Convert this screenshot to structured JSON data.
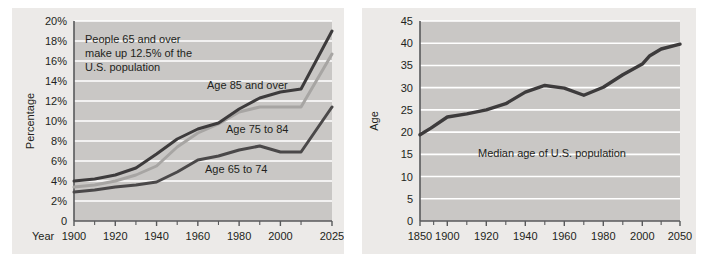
{
  "figure": {
    "background": "#ffffff",
    "panel_background": "#eceae8",
    "plot_background": "#c9c7c5",
    "gridline_color": "#ffffff",
    "axis_color": "#58595b",
    "text_color": "#231f20"
  },
  "chart_data": [
    {
      "id": "left",
      "type": "line",
      "title": "",
      "xlabel": "Year",
      "ylabel": "Percentage",
      "xlim": [
        1900,
        2025
      ],
      "ylim": [
        0,
        20
      ],
      "grid": true,
      "legend": "inline-labels",
      "x_tick_labels": [
        "1900",
        "1920",
        "1940",
        "1960",
        "1980",
        "2000",
        "2025"
      ],
      "x_tick_values": [
        1900,
        1920,
        1940,
        1960,
        1980,
        2000,
        2025
      ],
      "x_minor_ticks": [
        1910,
        1930,
        1950,
        1970,
        1990,
        2010
      ],
      "y_tick_labels": [
        "0",
        "2%",
        "4%",
        "6%",
        "8%",
        "10%",
        "12%",
        "14%",
        "16%",
        "18%",
        "20%"
      ],
      "y_tick_values": [
        0,
        2,
        4,
        6,
        8,
        10,
        12,
        14,
        16,
        18,
        20
      ],
      "annotation": "People 65 and over\nmake up 12.5% of the\nU.S. population",
      "annotation_lines": [
        "People 65 and over",
        "make up 12.5% of the",
        "U.S. population"
      ],
      "series": [
        {
          "name": "Age 85 and over",
          "label": "Age 85 and over",
          "color": "#3d3b3c",
          "x": [
            1900,
            1910,
            1920,
            1930,
            1940,
            1950,
            1960,
            1970,
            1980,
            1990,
            2000,
            2010,
            2025
          ],
          "values": [
            4.0,
            4.2,
            4.6,
            5.3,
            6.7,
            8.2,
            9.2,
            9.8,
            11.2,
            12.3,
            12.9,
            13.2,
            19.0
          ]
        },
        {
          "name": "Age 75 to 84",
          "label": "Age 75 to 84",
          "color": "#a7a5a3",
          "x": [
            1900,
            1910,
            1920,
            1930,
            1940,
            1950,
            1960,
            1970,
            1980,
            1990,
            2000,
            2010,
            2025
          ],
          "values": [
            3.4,
            3.6,
            4.0,
            4.6,
            5.5,
            7.4,
            8.8,
            9.7,
            10.9,
            11.4,
            11.4,
            11.4,
            16.7
          ]
        },
        {
          "name": "Age 65 to 74",
          "label": "Age 65 to 74",
          "color": "#4a4849",
          "x": [
            1900,
            1910,
            1920,
            1930,
            1940,
            1950,
            1960,
            1970,
            1980,
            1990,
            2000,
            2010,
            2025
          ],
          "values": [
            2.9,
            3.1,
            3.4,
            3.6,
            3.9,
            4.9,
            6.1,
            6.5,
            7.1,
            7.5,
            6.9,
            6.9,
            11.4
          ]
        }
      ]
    },
    {
      "id": "right",
      "type": "line",
      "title": "",
      "xlabel": "",
      "ylabel": "Age",
      "ylim": [
        0,
        45
      ],
      "grid": true,
      "x_tick_labels": [
        "1850",
        "1900",
        "1920",
        "1940",
        "1960",
        "1980",
        "2000",
        "2050"
      ],
      "x_tick_values": [
        1850,
        1900,
        1920,
        1940,
        1960,
        1980,
        2000,
        2050
      ],
      "y_tick_labels": [
        "0",
        "5",
        "10",
        "15",
        "20",
        "25",
        "30",
        "35",
        "40",
        "45"
      ],
      "y_tick_values": [
        0,
        5,
        10,
        15,
        20,
        25,
        30,
        35,
        40,
        45
      ],
      "annotation": "Median age of U.S. population",
      "series": [
        {
          "name": "Median age of U.S. population",
          "color": "#3d3b3c",
          "x": [
            1850,
            1870,
            1900,
            1910,
            1920,
            1930,
            1940,
            1950,
            1960,
            1970,
            1980,
            1990,
            2000,
            2010,
            2025,
            2050
          ],
          "values": [
            19.4,
            20.9,
            23.4,
            24.1,
            25.0,
            26.4,
            29.0,
            30.5,
            29.9,
            28.3,
            30.1,
            32.9,
            35.3,
            37.2,
            38.7,
            39.8
          ]
        }
      ]
    }
  ],
  "left_chart": {
    "y_axis_title": "Percentage",
    "x_axis_title": "Year"
  },
  "right_chart": {
    "y_axis_title": "Age",
    "annotation": "Median age of U.S. population"
  }
}
